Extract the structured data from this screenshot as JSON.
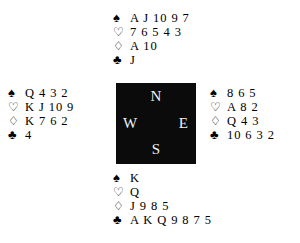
{
  "diagram": {
    "background_color": "#ffffff",
    "text_color": "#000000",
    "compass_box_color": "#0b0b0b",
    "compass_text_color": "#f2f2f2"
  },
  "suits": {
    "spade_symbol": "♠",
    "heart_symbol": "♡",
    "diamond_symbol": "♢",
    "club_symbol": "♣",
    "spade_name": "spades",
    "heart_name": "hearts",
    "diamond_name": "diamonds",
    "club_name": "clubs"
  },
  "compass": {
    "north_label": "N",
    "west_label": "W",
    "east_label": "E",
    "south_label": "S"
  },
  "hands": {
    "north": {
      "position_label": "North",
      "spades": "A J 10 9 7",
      "hearts": "7 6 5 4 3",
      "diamonds": "A 10",
      "clubs": "J"
    },
    "west": {
      "position_label": "West",
      "spades": "Q 4 3 2",
      "hearts": "K J 10 9",
      "diamonds": "K 7 6 2",
      "clubs": "4"
    },
    "east": {
      "position_label": "East",
      "spades": "8 6 5",
      "hearts": "A 8 2",
      "diamonds": "Q 4 3",
      "clubs": "10 6 3 2"
    },
    "south": {
      "position_label": "South",
      "spades": "K",
      "hearts": "Q",
      "diamonds": "J 9 8 5",
      "clubs": "A K Q 9 8 7 5"
    }
  }
}
